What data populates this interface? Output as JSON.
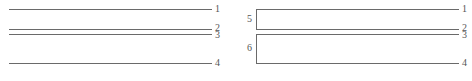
{
  "left_panel": {
    "lines": [
      {
        "id": "line-1",
        "label": "1",
        "y": 9
      },
      {
        "id": "line-2",
        "label": "2",
        "y": 29
      },
      {
        "id": "line-3",
        "label": "3",
        "y": 34
      },
      {
        "id": "line-4",
        "label": "4",
        "y": 63
      }
    ]
  },
  "right_panel": {
    "lines": [
      {
        "id": "line-1",
        "label": "1",
        "y": 9
      },
      {
        "id": "line-2",
        "label": "2",
        "y": 29
      },
      {
        "id": "line-3",
        "label": "3",
        "y": 34
      },
      {
        "id": "line-4",
        "label": "4",
        "y": 63
      }
    ],
    "brackets": [
      {
        "id": "bracket-5",
        "label": "5",
        "spans": [
          "1",
          "2"
        ]
      },
      {
        "id": "bracket-6",
        "label": "6",
        "spans": [
          "3",
          "4"
        ]
      }
    ]
  },
  "colors": {
    "line": "#6a6a6a",
    "text": "#555555",
    "background": "#ffffff"
  }
}
